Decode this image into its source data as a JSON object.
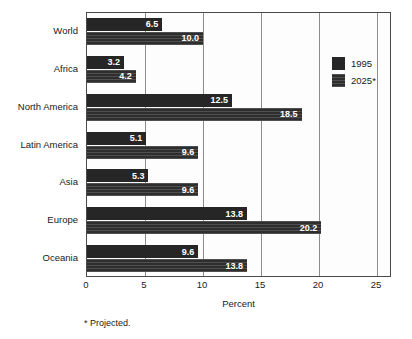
{
  "chart_data": {
    "type": "bar",
    "orientation": "horizontal",
    "title": "",
    "xlabel": "Percent",
    "ylabel": "",
    "xlim": [
      0,
      26.3
    ],
    "xticks": [
      0,
      5,
      10,
      15,
      20,
      25
    ],
    "grid": true,
    "legend_position": "inside-right",
    "categories": [
      "World",
      "Africa",
      "North America",
      "Latin America",
      "Asia",
      "Europe",
      "Oceania"
    ],
    "series": [
      {
        "name": "1995",
        "values": [
          6.5,
          3.2,
          12.5,
          5.1,
          5.3,
          13.8,
          9.6
        ],
        "labels": [
          "6.5",
          "3.2",
          "12.5",
          "5.1",
          "5.3",
          "13.8",
          "9.6"
        ],
        "color": "#262626"
      },
      {
        "name": "2025*",
        "values": [
          10.0,
          4.2,
          18.5,
          9.6,
          9.6,
          20.2,
          13.8
        ],
        "labels": [
          "10.0",
          "4.2",
          "18.5",
          "9.6",
          "9.6",
          "20.2",
          "13.8"
        ],
        "color": "#2e2e2e"
      }
    ],
    "annotations": [
      "* Projected."
    ]
  },
  "footnote": "* Projected.",
  "colors": {
    "frame": "#4a4a4a",
    "gridline": "#8d8d8d",
    "plot_background": "#fdfdfd",
    "page_background": "#ffffff",
    "value_label": "#ffffff"
  }
}
